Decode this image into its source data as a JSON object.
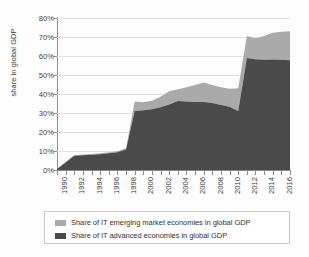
{
  "chart_data": {
    "type": "area",
    "stacked": true,
    "title": "",
    "subtitle": "",
    "xlabel": "",
    "ylabel": "share in global GDP",
    "ylim": [
      0,
      80
    ],
    "ytick_values": [
      0,
      10,
      20,
      30,
      40,
      50,
      60,
      70,
      80
    ],
    "ytick_labels": [
      "0%",
      "10%",
      "20%",
      "30%",
      "40%",
      "50%",
      "60%",
      "70%",
      "80%"
    ],
    "xlim": [
      1990,
      2017
    ],
    "grid": "horizontal",
    "legend_position": "bottom",
    "x": [
      1990,
      1991,
      1992,
      1993,
      1994,
      1995,
      1996,
      1997,
      1998,
      1999,
      2000,
      2001,
      2002,
      2003,
      2004,
      2005,
      2006,
      2007,
      2008,
      2009,
      2010,
      2011,
      2012,
      2013,
      2014,
      2015,
      2016,
      2017
    ],
    "xtick_labels": [
      "1990",
      "1992",
      "1994",
      "1996",
      "1998",
      "2000",
      "2002",
      "2004",
      "2006",
      "2008",
      "2010",
      "2012",
      "2014",
      "2016"
    ],
    "xtick_label_years": [
      1990,
      1992,
      1994,
      1996,
      1998,
      2000,
      2002,
      2004,
      2006,
      2008,
      2010,
      2012,
      2014,
      2016
    ],
    "series": [
      {
        "name": "Share of IT advanced economies in global GDP",
        "color": "#4a4a4a",
        "values": [
          0.5,
          4.0,
          7.5,
          7.8,
          8.0,
          8.3,
          8.8,
          9.3,
          10.8,
          31.0,
          31.5,
          32.0,
          33.0,
          34.5,
          36.3,
          36.0,
          35.8,
          35.8,
          35.3,
          34.2,
          33.3,
          31.0,
          59.0,
          58.3,
          58.0,
          58.2,
          58.0,
          57.8
        ]
      },
      {
        "name": "Share of IT emerging market economies in global GDP",
        "color": "#aaaaaa",
        "values": [
          0.2,
          0.3,
          0.3,
          0.4,
          0.4,
          0.5,
          0.5,
          0.6,
          0.7,
          5.0,
          4.2,
          4.5,
          5.5,
          7.0,
          6.2,
          7.5,
          9.0,
          10.2,
          9.5,
          9.3,
          9.5,
          12.0,
          11.5,
          11.0,
          12.5,
          14.0,
          14.8,
          15.2
        ]
      }
    ],
    "totals": [
      0.7,
      4.3,
      7.8,
      8.2,
      8.4,
      8.8,
      9.3,
      9.9,
      11.5,
      36.0,
      35.7,
      36.5,
      38.5,
      41.5,
      42.5,
      43.5,
      44.8,
      46.0,
      44.8,
      43.5,
      42.8,
      43.0,
      70.5,
      69.3,
      70.5,
      72.2,
      72.8,
      73.0
    ]
  },
  "legend": {
    "items": [
      {
        "label": "Share of IT emerging market economies in global GDP",
        "color": "#aaaaaa"
      },
      {
        "label": "Share of IT advanced economies in global GDP",
        "color": "#4a4a4a"
      }
    ]
  }
}
